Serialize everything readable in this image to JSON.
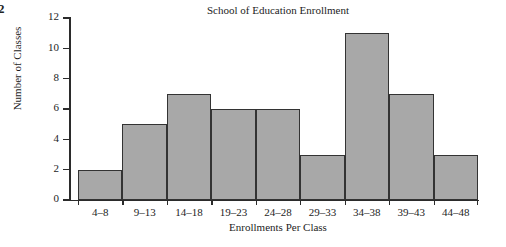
{
  "page_number": "2",
  "axis_style": {
    "bar_fill": "#a8a8a8",
    "bar_stroke": "#333333",
    "axis_color": "#2b2b2b"
  },
  "chart_data": {
    "type": "bar",
    "title": "School of Education Enrollment",
    "xlabel": "Enrollments Per Class",
    "ylabel": "Number of Classes",
    "categories": [
      "4–8",
      "9–13",
      "14–18",
      "19–23",
      "24–28",
      "29–33",
      "34–38",
      "39–43",
      "44–48"
    ],
    "values": [
      2,
      5,
      7,
      6,
      6,
      3,
      11,
      7,
      3
    ],
    "ylim": [
      0,
      12
    ],
    "yticks": [
      0,
      2,
      4,
      6,
      8,
      10,
      12
    ],
    "ytick_labels": [
      "0",
      "2",
      "4",
      "6",
      "8",
      "10",
      "12"
    ],
    "grid": false,
    "legend": false
  }
}
